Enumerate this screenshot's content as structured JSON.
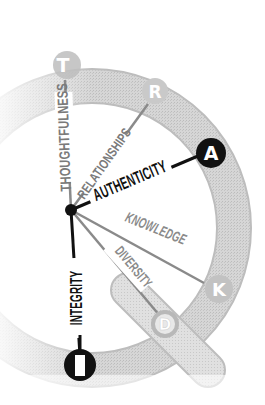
{
  "diagram": {
    "colors": {
      "ring": "#d2d2d2",
      "ring_edge": "#b5b5b5",
      "tail": "#dcdcdc",
      "tail_edge": "#bdbdbd",
      "hub": "#111111",
      "spoke_dark": "#111111",
      "spoke_light": "#8a8a8a",
      "node_dark_fill": "#111111",
      "node_light_fill": "#c9c9c9",
      "label_dark": "#111111",
      "label_light": "#7a7a7a"
    },
    "nodes": [
      {
        "letter": "T",
        "label": "THOUGHTFULNESS",
        "style": "light"
      },
      {
        "letter": "R",
        "label": "RELATIONSHIPS",
        "style": "light"
      },
      {
        "letter": "A",
        "label": "AUTHENTICITY",
        "style": "dark"
      },
      {
        "letter": "K",
        "label": "KNOWLEDGE",
        "style": "light"
      },
      {
        "letter": "D",
        "label": "DIVERSITY",
        "style": "light"
      },
      {
        "letter": "I",
        "label": "INTEGRITY",
        "style": "dark"
      }
    ]
  }
}
